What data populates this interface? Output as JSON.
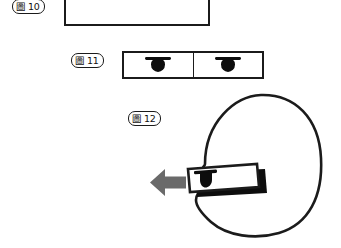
{
  "page": {
    "background_color": "#ffffff",
    "ink_color": "#1b1b1b",
    "fill_color": "#0d0d0d",
    "arrow_color": "#6a6a6a",
    "width": 341,
    "height": 248
  },
  "figures": [
    {
      "id": "fig-10",
      "label_cjk": "圖",
      "label_number": "10",
      "caption": "圖10",
      "shape": "empty-rectangle",
      "description": "plain open rectangle, cropped by top edge of page"
    },
    {
      "id": "fig-11",
      "label_cjk": "圖",
      "label_number": "11",
      "caption": "圖11",
      "shape": "two-cell-rectangle",
      "cells": [
        {
          "name": "left-cell",
          "glyph": "dome-icon"
        },
        {
          "name": "right-cell",
          "glyph": "dome-icon"
        }
      ],
      "description": "horizontal rectangle split into two equal cells, each containing a solid black dome glyph"
    },
    {
      "id": "fig-12",
      "label_cjk": "圖",
      "label_number": "12",
      "caption": "圖12",
      "shape": "head-with-device",
      "parts": [
        {
          "name": "head-outline",
          "glyph": "rounded-head-outline"
        },
        {
          "name": "insertion-arrow",
          "glyph": "left-arrow-icon",
          "direction": "left"
        },
        {
          "name": "device-body",
          "glyph": "device-rectangle-with-shadow"
        },
        {
          "name": "device-dome",
          "glyph": "dome-icon"
        }
      ],
      "description": "rounded head profile with a rectangular device overlapping its left side and a grey arrow pointing left"
    }
  ]
}
